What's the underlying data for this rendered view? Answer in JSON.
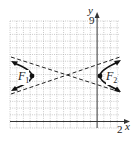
{
  "diagram": {
    "type": "hyperbola",
    "axes": {
      "x_label": "x",
      "y_label": "y",
      "x_tick_label": "2",
      "y_tick_label": "9"
    },
    "foci": [
      {
        "label": "F",
        "subscript": "1"
      },
      {
        "label": "F",
        "subscript": "2"
      }
    ],
    "colors": {
      "grid": "#9a9a9a",
      "curve": "#111111",
      "asymptote": "#222222",
      "axis": "#333333"
    }
  }
}
